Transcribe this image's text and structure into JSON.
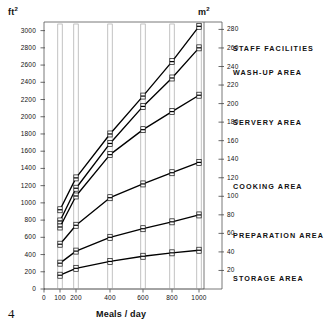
{
  "figure": {
    "page_number": "4",
    "y_axis_left_unit": "ft",
    "y_axis_left_unit_exponent": "2",
    "y_axis_right_unit": "m",
    "y_axis_right_unit_exponent": "2",
    "x_axis_title": "Meals / day"
  },
  "chart_data": {
    "type": "line",
    "title": "",
    "subtitle": "",
    "xlabel": "Meals / day",
    "ylabel": "ft²",
    "y2label": "m²",
    "grid": false,
    "legend_position": "right-inline",
    "x_scale": "compressed-nonlinear",
    "x": [
      100,
      200,
      400,
      600,
      800,
      1000
    ],
    "xtick_labels": [
      "0",
      "100",
      "200",
      "400",
      "600",
      "800",
      "1000"
    ],
    "xtick_values": [
      0,
      100,
      200,
      400,
      600,
      800,
      1000
    ],
    "xlim": [
      0,
      1000
    ],
    "ylim": [
      0,
      3100
    ],
    "ytick_labels_left": [
      "3000",
      "2800",
      "2600",
      "2400",
      "2200",
      "2000",
      "1800",
      "1600",
      "1400",
      "1200",
      "1000",
      "800",
      "600",
      "400",
      "200",
      "0"
    ],
    "ytick_values_left": [
      3000,
      2800,
      2600,
      2400,
      2200,
      2000,
      1800,
      1600,
      1400,
      1200,
      1000,
      800,
      600,
      400,
      200,
      0
    ],
    "ytick_labels_right": [
      "280",
      "260",
      "240",
      "220",
      "200",
      "180",
      "160",
      "140",
      "120",
      "100",
      "80",
      "60",
      "40",
      "20"
    ],
    "ytick_values_right": [
      280,
      260,
      240,
      220,
      200,
      180,
      160,
      140,
      120,
      100,
      80,
      60,
      40,
      20
    ],
    "y2lim": [
      0,
      288
    ],
    "conversion_note": "right axis m² = left axis ft² / 10.764",
    "series": [
      {
        "name": "STAFF FACILITIES",
        "label_y_px": 44,
        "values_ft2": [
          920,
          1290,
          1800,
          2240,
          2640,
          3050
        ],
        "values_m2": [
          85,
          120,
          167,
          208,
          245,
          283
        ]
      },
      {
        "name": "WASH-UP AREA",
        "label_y_px": 68,
        "values_ft2": [
          790,
          1170,
          1690,
          2120,
          2450,
          2800
        ],
        "values_m2": [
          73,
          109,
          157,
          197,
          228,
          260
        ]
      },
      {
        "name": "SERVERY AREA",
        "label_y_px": 118,
        "values_ft2": [
          720,
          1080,
          1560,
          1850,
          2060,
          2250
        ],
        "values_m2": [
          67,
          100,
          145,
          172,
          191,
          209
        ]
      },
      {
        "name": "COOKING AREA",
        "label_y_px": 182,
        "values_ft2": [
          520,
          740,
          1060,
          1220,
          1350,
          1470
        ],
        "values_m2": [
          48,
          69,
          98,
          113,
          125,
          137
        ]
      },
      {
        "name": "PREPARATION AREA",
        "label_y_px": 231,
        "values_ft2": [
          300,
          440,
          600,
          700,
          780,
          860
        ],
        "values_m2": [
          28,
          41,
          56,
          65,
          72,
          80
        ]
      },
      {
        "name": "STORAGE AREA",
        "label_y_px": 274,
        "values_ft2": [
          160,
          240,
          320,
          380,
          420,
          450
        ],
        "values_m2": [
          15,
          22,
          30,
          35,
          39,
          42
        ]
      }
    ],
    "markers": {
      "description": "open rectangular bar/box markers drawn as thin vertical open rectangles at each x station",
      "style": "open-rect"
    }
  }
}
